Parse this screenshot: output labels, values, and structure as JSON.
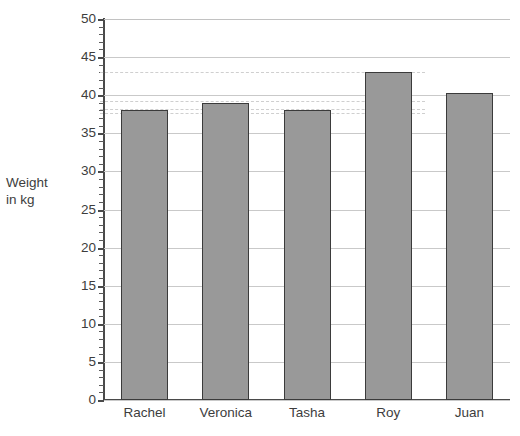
{
  "chart_data": {
    "type": "bar",
    "title": "",
    "clipped_top_text": "",
    "xlabel": "",
    "ylabel": "Weight in kg",
    "ylabel_lines": [
      "Weight",
      "in kg"
    ],
    "categories": [
      "Rachel",
      "Veronica",
      "Tasha",
      "Roy",
      "Juan"
    ],
    "values": [
      38,
      39,
      38,
      43,
      40.3
    ],
    "series": [
      {
        "name": "Weight in kg",
        "values": [
          38,
          39,
          38,
          43,
          40.3
        ]
      }
    ],
    "ylim": [
      0,
      50
    ],
    "ytick_step": 5,
    "yminor_step": 1,
    "ytick_labels": [
      "50",
      "45",
      "40",
      "35",
      "30",
      "25",
      "20",
      "15",
      "10",
      "5",
      "0"
    ],
    "ytick_values": [
      50,
      45,
      40,
      35,
      30,
      25,
      20,
      15,
      10,
      5,
      0
    ],
    "grid": true,
    "grid_axis": "y",
    "legend": false,
    "legend_position": "none",
    "guide_lines": [
      43,
      39.2,
      38.2,
      37.7
    ],
    "colors": {
      "bar_fill": "#999999",
      "bar_stroke": "#3b3b3b",
      "grid": "#c9c9c9",
      "guide": "#cfcfcf",
      "axis": "#4a4a4a",
      "text": "#3d3d3d",
      "background": "#ffffff"
    }
  }
}
